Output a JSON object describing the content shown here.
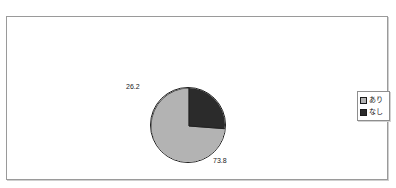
{
  "chart_data": {
    "type": "pie",
    "title": "",
    "xlabel": "",
    "ylabel": "",
    "categories": [
      "あり",
      "なし"
    ],
    "values": [
      73.8,
      26.2
    ],
    "data_labels": [
      "73.8",
      "26.2"
    ],
    "series": [
      {
        "name": "",
        "slices": [
          {
            "label": "あり",
            "value": 73.8,
            "display": "73.8",
            "color": "#b3b3b3"
          },
          {
            "label": "なし",
            "value": 26.2,
            "display": "26.2",
            "color": "#2b2b2b"
          }
        ]
      }
    ],
    "legend": {
      "position": "right",
      "entries": [
        {
          "label": "あり",
          "color": "#b3b3b3"
        },
        {
          "label": "なし",
          "color": "#2b2b2b"
        }
      ]
    },
    "grid": false,
    "start_angle_deg": 90,
    "direction": "counterclockwise"
  },
  "labels": {
    "dark_slice_value": "26.2",
    "light_slice_value": "73.8"
  },
  "legend": {
    "ari_label": "あり",
    "nashi_label": "なし"
  },
  "header": {
    "title_clipped": ""
  },
  "colors": {
    "light_slice": "#b3b3b3",
    "dark_slice": "#2b2b2b",
    "frame_border": "#9a9a9a",
    "outline": "#1c1c1c",
    "background": "#ffffff"
  }
}
